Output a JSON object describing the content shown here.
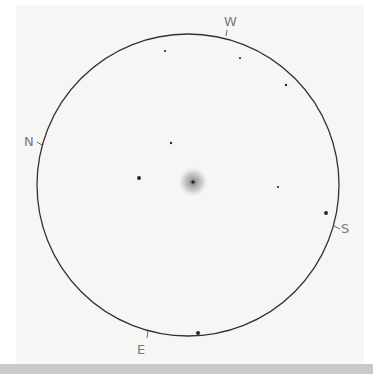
{
  "sketch": {
    "type": "eyepiece field sketch",
    "field_circle": {
      "cx": 188,
      "cy": 185,
      "r": 151,
      "stroke": "#333333"
    },
    "object": {
      "cx": 193,
      "cy": 182,
      "halo_r": 16,
      "core_r": 2
    },
    "compass": {
      "north": "N",
      "south": "S",
      "east": "E",
      "west": "W"
    },
    "stars": [
      {
        "x": 165,
        "y": 51,
        "r": 1.1
      },
      {
        "x": 240,
        "y": 58,
        "r": 1.1
      },
      {
        "x": 286,
        "y": 85,
        "r": 1.2
      },
      {
        "x": 171,
        "y": 143,
        "r": 1.2
      },
      {
        "x": 139,
        "y": 178,
        "r": 2
      },
      {
        "x": 278,
        "y": 187,
        "r": 1.1
      },
      {
        "x": 326,
        "y": 213,
        "r": 2
      },
      {
        "x": 198,
        "y": 333,
        "r": 2
      }
    ]
  }
}
